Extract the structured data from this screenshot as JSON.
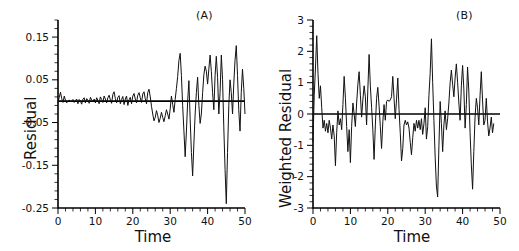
{
  "figure": {
    "background": "#ffffff",
    "foreground": "#111111"
  },
  "panels": [
    {
      "key": "a",
      "label": "(A)",
      "ylabel": "Residual",
      "xlabel": "Time"
    },
    {
      "key": "b",
      "label": "(B)",
      "ylabel": "Weighted  Residual",
      "xlabel": "Time"
    }
  ],
  "chart_data": [
    {
      "type": "line",
      "panel": "(A)",
      "title": "",
      "xlabel": "Time",
      "ylabel": "Residual",
      "xlim": [
        0,
        50
      ],
      "ylim": [
        -0.25,
        0.19
      ],
      "xticks": [
        0,
        10,
        20,
        30,
        40,
        50
      ],
      "xticklabels": [
        "0",
        "10",
        "20",
        "30",
        "40",
        "50"
      ],
      "yticks": [
        0.15,
        0.05,
        -0.05,
        -0.15,
        -0.25
      ],
      "yticklabels": [
        "0.15",
        "0.05",
        "-0.05",
        "-0.15",
        "-0.25"
      ],
      "grid": false,
      "legend": null,
      "reference_line": {
        "y": 0,
        "orientation": "horizontal"
      },
      "annotations": [
        "heteroscedastic: residual spread widens with time"
      ],
      "x": [
        0.0,
        0.33,
        0.67,
        1.0,
        1.33,
        1.67,
        2.0,
        2.33,
        2.67,
        3.0,
        3.33,
        3.67,
        4.0,
        4.33,
        4.67,
        5.0,
        5.33,
        5.67,
        6.0,
        6.33,
        6.67,
        7.0,
        7.33,
        7.67,
        8.0,
        8.33,
        8.67,
        9.0,
        9.33,
        9.67,
        10.0,
        10.33,
        10.67,
        11.0,
        11.33,
        11.67,
        12.0,
        12.33,
        12.67,
        13.0,
        13.33,
        13.67,
        14.0,
        14.33,
        14.67,
        15.0,
        15.33,
        15.67,
        16.0,
        16.33,
        16.67,
        17.0,
        17.33,
        17.67,
        18.0,
        18.33,
        18.67,
        19.0,
        19.33,
        19.67,
        20.0,
        20.33,
        20.67,
        21.0,
        21.33,
        21.67,
        22.0,
        22.33,
        22.67,
        23.0,
        23.33,
        23.67,
        24.0,
        24.33,
        24.67,
        25.0,
        25.33,
        25.67,
        26.0,
        26.33,
        26.67,
        27.0,
        27.33,
        27.67,
        28.0,
        28.33,
        28.67,
        29.0,
        29.33,
        29.67,
        30.0,
        30.33,
        30.67,
        31.0,
        31.33,
        31.67,
        32.0,
        32.33,
        32.67,
        33.0,
        33.33,
        33.67,
        34.0,
        34.33,
        34.67,
        35.0,
        35.33,
        35.67,
        36.0,
        36.33,
        36.67,
        37.0,
        37.33,
        37.67,
        38.0,
        38.33,
        38.67,
        39.0,
        39.33,
        39.67,
        40.0,
        40.33,
        40.67,
        41.0,
        41.33,
        41.67,
        42.0,
        42.33,
        42.67,
        43.0,
        43.33,
        43.67,
        44.0,
        44.33,
        44.67,
        45.0,
        45.33,
        45.67,
        46.0,
        46.33,
        46.67,
        47.0,
        47.33,
        47.67,
        48.0,
        48.33,
        48.67,
        49.0,
        49.33,
        49.67,
        50.0
      ],
      "y": [
        -0.004,
        0.009,
        0.021,
        0.006,
        -0.003,
        0.012,
        0.002,
        -0.004,
        0.0,
        0.003,
        -0.002,
        0.001,
        0.004,
        -0.003,
        0.002,
        0.005,
        -0.006,
        0.004,
        0.0,
        -0.007,
        0.005,
        0.008,
        -0.004,
        0.006,
        0.002,
        -0.005,
        0.009,
        0.003,
        -0.002,
        0.005,
        -0.004,
        0.008,
        0.002,
        -0.006,
        0.01,
        0.004,
        -0.003,
        0.012,
        0.005,
        -0.004,
        0.008,
        0.014,
        0.003,
        -0.005,
        0.016,
        0.022,
        0.006,
        -0.004,
        0.009,
        0.013,
        -0.006,
        0.004,
        0.011,
        -0.008,
        0.005,
        0.012,
        -0.01,
        0.003,
        0.009,
        -0.006,
        0.012,
        0.018,
        0.005,
        -0.004,
        0.014,
        0.02,
        0.008,
        -0.003,
        0.017,
        0.022,
        0.006,
        -0.006,
        0.02,
        0.028,
        0.01,
        -0.012,
        -0.03,
        -0.046,
        -0.038,
        -0.022,
        -0.034,
        -0.05,
        -0.04,
        -0.026,
        -0.038,
        -0.048,
        -0.034,
        -0.02,
        -0.03,
        -0.042,
        -0.018,
        0.012,
        -0.008,
        -0.026,
        0.004,
        0.03,
        0.058,
        0.095,
        0.112,
        0.06,
        -0.01,
        -0.07,
        -0.13,
        -0.072,
        0.0,
        0.048,
        -0.04,
        -0.12,
        -0.175,
        -0.1,
        -0.03,
        0.02,
        0.056,
        -0.01,
        -0.052,
        -0.03,
        0.02,
        0.062,
        0.082,
        0.07,
        0.04,
        0.075,
        0.108,
        0.07,
        0.02,
        -0.02,
        0.06,
        0.105,
        0.055,
        -0.03,
        0.02,
        0.108,
        0.05,
        -0.06,
        -0.16,
        -0.24,
        -0.12,
        -0.01,
        0.05,
        0.02,
        -0.03,
        0.04,
        0.095,
        0.13,
        0.06,
        -0.02,
        -0.07,
        0.02,
        0.075,
        0.03,
        -0.03,
        -0.085,
        -0.06,
        -0.02,
        -0.085,
        -0.05
      ]
    },
    {
      "type": "line",
      "panel": "(B)",
      "title": "",
      "xlabel": "Time",
      "ylabel": "Weighted  Residual",
      "xlim": [
        0,
        50
      ],
      "ylim": [
        -3,
        3
      ],
      "xticks": [
        0,
        10,
        20,
        30,
        40,
        50
      ],
      "xticklabels": [
        "0",
        "10",
        "20",
        "30",
        "40",
        "50"
      ],
      "yticks": [
        3,
        2,
        1,
        0,
        -1,
        -2,
        -3
      ],
      "yticklabels": [
        "3",
        "2",
        "1",
        "0",
        "-1",
        "-2",
        "-3"
      ],
      "grid": false,
      "legend": null,
      "reference_line": {
        "y": 0,
        "orientation": "horizontal"
      },
      "annotations": [
        "homoscedastic: weighted residual spread roughly constant"
      ],
      "x": [
        0.0,
        0.33,
        0.67,
        1.0,
        1.33,
        1.67,
        2.0,
        2.33,
        2.67,
        3.0,
        3.33,
        3.67,
        4.0,
        4.33,
        4.67,
        5.0,
        5.33,
        5.67,
        6.0,
        6.33,
        6.67,
        7.0,
        7.33,
        7.67,
        8.0,
        8.33,
        8.67,
        9.0,
        9.33,
        9.67,
        10.0,
        10.33,
        10.67,
        11.0,
        11.33,
        11.67,
        12.0,
        12.33,
        12.67,
        13.0,
        13.33,
        13.67,
        14.0,
        14.33,
        14.67,
        15.0,
        15.33,
        15.67,
        16.0,
        16.33,
        16.67,
        17.0,
        17.33,
        17.67,
        18.0,
        18.33,
        18.67,
        19.0,
        19.33,
        19.67,
        20.0,
        20.33,
        20.67,
        21.0,
        21.33,
        21.67,
        22.0,
        22.33,
        22.67,
        23.0,
        23.33,
        23.67,
        24.0,
        24.33,
        24.67,
        25.0,
        25.33,
        25.67,
        26.0,
        26.33,
        26.67,
        27.0,
        27.33,
        27.67,
        28.0,
        28.33,
        28.67,
        29.0,
        29.33,
        29.67,
        30.0,
        30.33,
        30.67,
        31.0,
        31.33,
        31.67,
        32.0,
        32.33,
        32.67,
        33.0,
        33.33,
        33.67,
        34.0,
        34.33,
        34.67,
        35.0,
        35.33,
        35.67,
        36.0,
        36.33,
        36.67,
        37.0,
        37.33,
        37.67,
        38.0,
        38.33,
        38.67,
        39.0,
        39.33,
        39.67,
        40.0,
        40.33,
        40.67,
        41.0,
        41.33,
        41.67,
        42.0,
        42.33,
        42.67,
        43.0,
        43.33,
        43.67,
        44.0,
        44.33,
        44.67,
        45.0,
        45.33,
        45.67,
        46.0,
        46.33,
        46.67,
        47.0,
        47.33,
        47.67,
        48.0,
        48.33,
        48.67,
        49.0,
        49.33,
        49.67,
        50.0
      ],
      "y": [
        -0.9,
        0.6,
        1.5,
        2.5,
        1.3,
        0.5,
        0.9,
        0.2,
        -0.45,
        -0.2,
        -0.55,
        -0.3,
        -0.6,
        -0.2,
        -0.45,
        -0.8,
        -0.35,
        -0.7,
        -1.65,
        -0.6,
        0.1,
        -0.35,
        -0.15,
        -0.5,
        0.3,
        1.2,
        0.5,
        -0.4,
        -1.2,
        -0.5,
        -1.55,
        -0.4,
        0.35,
        0.0,
        -0.4,
        0.35,
        0.95,
        1.35,
        0.6,
        -0.1,
        0.45,
        0.9,
        0.55,
        -0.35,
        0.8,
        1.9,
        0.9,
        0.2,
        -0.5,
        -1.45,
        -0.35,
        0.5,
        0.85,
        0.25,
        -0.4,
        -1.1,
        -0.25,
        0.3,
        -0.2,
        0.4,
        0.45,
        0.4,
        0.45,
        0.55,
        1.2,
        0.5,
        -0.15,
        0.45,
        1.15,
        0.15,
        -0.6,
        -1.5,
        -1.1,
        -0.35,
        -0.2,
        -0.35,
        -0.25,
        -0.45,
        -0.9,
        -1.3,
        -0.75,
        -0.3,
        -0.55,
        -0.2,
        -0.45,
        -0.2,
        -0.5,
        -0.15,
        -0.65,
        -0.3,
        0.2,
        -0.8,
        -0.4,
        0.6,
        1.3,
        2.4,
        1.0,
        -0.2,
        -1.4,
        -2.3,
        -2.65,
        -1.0,
        0.4,
        -0.3,
        -1.2,
        -0.35,
        0.1,
        -0.5,
        -0.15,
        0.35,
        1.0,
        1.4,
        0.95,
        0.55,
        1.15,
        1.6,
        1.0,
        0.35,
        -0.2,
        0.9,
        1.55,
        0.8,
        -0.45,
        0.3,
        1.5,
        0.7,
        -0.6,
        -1.6,
        -2.4,
        -1.2,
        -0.1,
        0.5,
        0.2,
        -0.35,
        0.6,
        1.35,
        0.45,
        -0.35,
        -0.2,
        0.5,
        -0.25,
        -0.7,
        -0.45,
        -0.1,
        -0.6,
        -0.3
      ]
    }
  ]
}
